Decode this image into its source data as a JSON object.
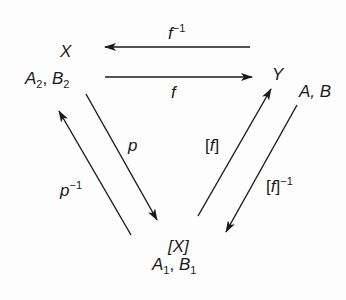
{
  "diagram": {
    "type": "commutative-diagram",
    "nodes": [
      {
        "id": "X",
        "symbol": "X",
        "subscript_label": {
          "A": "A",
          "a_sub": "2",
          "sep": ", ",
          "B": "B",
          "b_sub": "2"
        }
      },
      {
        "id": "Y",
        "symbol": "Y",
        "label": "A, B"
      },
      {
        "id": "[X]",
        "symbol": "[X]",
        "subscript_label": {
          "A": "A",
          "a_sub": "1",
          "sep": ", ",
          "B": "B",
          "b_sub": "1"
        }
      }
    ],
    "edges": [
      {
        "id": "f_inv",
        "from": "Y",
        "to": "X",
        "label": "f",
        "sup": "−1"
      },
      {
        "id": "f",
        "from": "X",
        "to": "Y",
        "label": "f"
      },
      {
        "id": "p",
        "from": "X",
        "to": "[X]",
        "label": "p"
      },
      {
        "id": "p_inv",
        "from": "[X]",
        "to": "X",
        "label": "p",
        "sup": "−1"
      },
      {
        "id": "bf",
        "from": "[X]",
        "to": "Y",
        "label_open": "[",
        "label": "f",
        "label_close": "]"
      },
      {
        "id": "bf_inv",
        "from": "Y",
        "to": "[X]",
        "label_open": "[",
        "label": "f",
        "label_close": "]",
        "sup": "−1"
      }
    ],
    "colors": {
      "stroke": "#1a1a1a",
      "background": "#fdfdfd"
    }
  }
}
